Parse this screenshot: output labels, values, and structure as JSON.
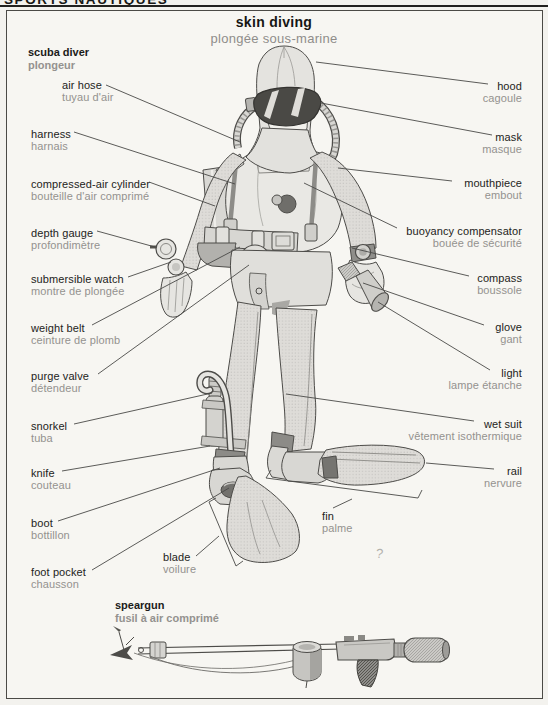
{
  "kicker": "SPORTS NAUTIQUES",
  "title": {
    "en": "skin diving",
    "fr": "plongée sous-marine"
  },
  "sections": {
    "diver": {
      "en": "scuba diver",
      "fr": "plongeur"
    },
    "speargun": {
      "en": "speargun",
      "fr": "fusil à air comprimé"
    }
  },
  "labels": {
    "left": [
      {
        "en": "air hose",
        "fr": "tuyau d'air"
      },
      {
        "en": "harness",
        "fr": "harnais"
      },
      {
        "en": "compressed-air cylinder",
        "fr": "bouteille d'air comprimé"
      },
      {
        "en": "depth gauge",
        "fr": "profondimètre"
      },
      {
        "en": "submersible watch",
        "fr": "montre de plongée"
      },
      {
        "en": "weight belt",
        "fr": "ceinture de plomb"
      },
      {
        "en": "purge valve",
        "fr": "détendeur"
      },
      {
        "en": "snorkel",
        "fr": "tuba"
      },
      {
        "en": "knife",
        "fr": "couteau"
      },
      {
        "en": "boot",
        "fr": "bottillon"
      },
      {
        "en": "foot pocket",
        "fr": "chausson"
      }
    ],
    "right": [
      {
        "en": "hood",
        "fr": "cagoule"
      },
      {
        "en": "mask",
        "fr": "masque"
      },
      {
        "en": "mouthpiece",
        "fr": "embout"
      },
      {
        "en": "buoyancy compensator",
        "fr": "bouée de sécurité"
      },
      {
        "en": "compass",
        "fr": "boussole"
      },
      {
        "en": "glove",
        "fr": "gant"
      },
      {
        "en": "light",
        "fr": "lampe étanche"
      },
      {
        "en": "wet suit",
        "fr": "vêtement isothermique"
      },
      {
        "en": "rail",
        "fr": "nervure"
      }
    ],
    "center": [
      {
        "en": "blade",
        "fr": "voilure"
      },
      {
        "en": "fin",
        "fr": "palme"
      }
    ]
  },
  "stray_mark": "?",
  "colors": {
    "paper": "#f7f6f2",
    "ink": "#1b1b19",
    "muted_gray": "#94928f",
    "leader_line": "#4a4a47",
    "figure_fill": "#e3e2de",
    "figure_dark": "#4a4947"
  }
}
